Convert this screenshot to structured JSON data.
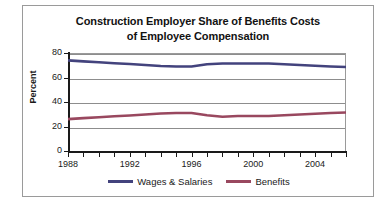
{
  "chart_data": {
    "type": "line",
    "title": "Construction Employer Share of Benefits Costs of Employee Compensation",
    "title_line1": "Construction Employer Share of Benefits Costs",
    "title_line2": "of Employee Compensation",
    "xlabel": "",
    "ylabel": "Percent",
    "ylim": [
      0,
      80
    ],
    "yticks": [
      0,
      20,
      40,
      60,
      80
    ],
    "ytick_labels": [
      "0",
      "20",
      "40",
      "60",
      "80"
    ],
    "xlim": [
      1988,
      2006
    ],
    "x": [
      1988,
      1989,
      1990,
      1991,
      1992,
      1993,
      1994,
      1995,
      1996,
      1997,
      1998,
      1999,
      2000,
      2001,
      2002,
      2003,
      2004,
      2005,
      2006
    ],
    "xticks": [
      1988,
      1989,
      1990,
      1991,
      1992,
      1993,
      1994,
      1995,
      1996,
      1997,
      1998,
      1999,
      2000,
      2001,
      2002,
      2003,
      2004,
      2005,
      2006
    ],
    "xtick_labels_shown": [
      "1988",
      "1992",
      "1996",
      "2000",
      "2004"
    ],
    "xtick_labels_shown_values": [
      1988,
      1992,
      1996,
      2000,
      2004
    ],
    "grid": true,
    "grid_axis": "y",
    "legend_position": "bottom",
    "series": [
      {
        "name": "Wages & Salaries",
        "color": "#43437d",
        "values": [
          74.0,
          73.2,
          72.4,
          71.6,
          71.0,
          70.2,
          69.4,
          69.0,
          69.0,
          70.8,
          71.4,
          71.4,
          71.4,
          71.4,
          70.8,
          70.2,
          69.6,
          69.0,
          68.6
        ]
      },
      {
        "name": "Benefits",
        "color": "#99485f",
        "values": [
          26.0,
          26.8,
          27.6,
          28.4,
          29.0,
          29.8,
          30.6,
          31.0,
          31.0,
          29.2,
          28.0,
          28.6,
          28.6,
          28.6,
          29.2,
          29.8,
          30.4,
          31.0,
          31.4
        ]
      }
    ]
  },
  "axes": {
    "y_title": "Percent"
  },
  "legend": {
    "items": [
      {
        "label": "Wages & Salaries",
        "color": "#43437d"
      },
      {
        "label": "Benefits",
        "color": "#99485f"
      }
    ]
  }
}
